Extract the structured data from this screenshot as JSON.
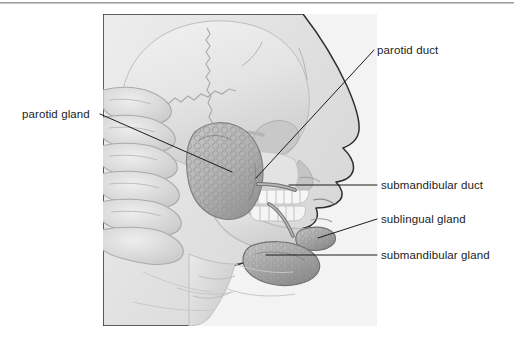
{
  "figure": {
    "type": "anatomical-illustration",
    "style": "grayscale medical illustration",
    "panel": {
      "x": 103,
      "y": 14,
      "width": 274,
      "height": 312,
      "background": "#f3f3f3"
    }
  },
  "colors": {
    "background": "#ffffff",
    "panel_background": "#f3f3f3",
    "bone_light": "#ececec",
    "bone_mid": "#dcdcdc",
    "bone_shadow": "#c3c3c3",
    "outline": "#3a3a3a",
    "gland_fill": "#b9b9b9",
    "gland_shadow": "#9a9a9a",
    "label_text": "#1c1c1c",
    "leader_line": "#1c1c1c",
    "top_rule": "#8e8e8e"
  },
  "labels": [
    {
      "id": "parotid-gland",
      "text": "parotid gland",
      "side": "left",
      "text_x": 22,
      "text_y": 108,
      "leader_start": {
        "x": 100,
        "y": 114
      },
      "leader_end": {
        "x": 232,
        "y": 172
      }
    },
    {
      "id": "parotid-duct",
      "text": "parotid duct",
      "side": "right",
      "text_x": 377,
      "text_y": 44,
      "leader_start": {
        "x": 374,
        "y": 50
      },
      "leader_end": {
        "x": 256,
        "y": 178
      }
    },
    {
      "id": "submandibular-duct",
      "text": "submandibular duct",
      "side": "right",
      "text_x": 381,
      "text_y": 179,
      "leader_start": {
        "x": 377,
        "y": 185
      },
      "leader_end": {
        "x": 289,
        "y": 185
      }
    },
    {
      "id": "sublingual-gland",
      "text": "sublingual gland",
      "side": "right",
      "text_x": 381,
      "text_y": 213,
      "leader_start": {
        "x": 377,
        "y": 219
      },
      "leader_end": {
        "x": 318,
        "y": 238
      }
    },
    {
      "id": "submandibular-gland",
      "text": "submandibular gland",
      "side": "right",
      "text_x": 381,
      "text_y": 249,
      "leader_start": {
        "x": 377,
        "y": 255
      },
      "leader_end": {
        "x": 266,
        "y": 255
      }
    }
  ],
  "structures": [
    {
      "id": "cranium",
      "name": "cranium",
      "note": "skull vault with serrated suture lines"
    },
    {
      "id": "parotid-gland-shape",
      "name": "parotid gland",
      "note": "large lobulated mass anterior to ear"
    },
    {
      "id": "parotid-duct-shape",
      "name": "parotid duct",
      "note": "thin tube crossing masseter to cheek"
    },
    {
      "id": "sublingual-gland-shape",
      "name": "sublingual gland",
      "note": "small gland under tongue floor"
    },
    {
      "id": "submandibular-gland-shape",
      "name": "submandibular gland",
      "note": "gland below mandible angle"
    },
    {
      "id": "maxillary-teeth",
      "name": "upper teeth row"
    },
    {
      "id": "mandibular-teeth",
      "name": "lower teeth row"
    },
    {
      "id": "cervical-vertebrae",
      "name": "cervical vertebrae"
    },
    {
      "id": "mandible",
      "name": "mandible"
    },
    {
      "id": "face-profile",
      "name": "facial soft tissue profile"
    }
  ]
}
